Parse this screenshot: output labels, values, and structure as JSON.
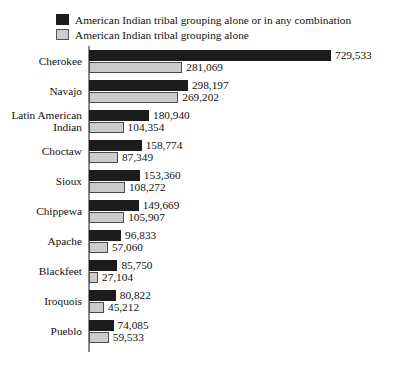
{
  "legend": {
    "entries": [
      {
        "label": "American Indian tribal grouping alone or in any combination",
        "swatch": "dark",
        "color": "#1c1c1c"
      },
      {
        "label": "American Indian tribal grouping alone",
        "swatch": "light",
        "color": "#cccccc"
      }
    ]
  },
  "chart_data": {
    "type": "bar",
    "orientation": "horizontal",
    "title": "",
    "subtitle": "",
    "xlabel": "",
    "ylabel": "",
    "grid": false,
    "legend_position": "top-left",
    "axis_max": 729533,
    "xlim": [
      0,
      760000
    ],
    "categories": [
      "Cherokee",
      "Navajo",
      "Latin American Indian",
      "Choctaw",
      "Sioux",
      "Chippewa",
      "Apache",
      "Blackfeet",
      "Iroquois",
      "Pueblo"
    ],
    "series": [
      {
        "name": "American Indian tribal grouping alone or in any combination",
        "color": "#1c1c1c",
        "values": [
          729533,
          298197,
          180940,
          158774,
          153360,
          149669,
          96833,
          85750,
          80822,
          74085
        ],
        "labels": [
          "729,533",
          "298,197",
          "180,940",
          "158,774",
          "153,360",
          "149,669",
          "96,833",
          "85,750",
          "80,822",
          "74,085"
        ]
      },
      {
        "name": "American Indian tribal grouping alone",
        "color": "#cccccc",
        "values": [
          281069,
          269202,
          104354,
          87349,
          108272,
          105907,
          57060,
          27104,
          45212,
          59533
        ],
        "labels": [
          "281,069",
          "269,202",
          "104,354",
          "87,349",
          "108,272",
          "105,907",
          "57,060",
          "27,104",
          "45,212",
          "59,533"
        ]
      }
    ]
  }
}
